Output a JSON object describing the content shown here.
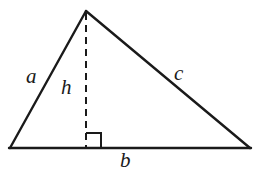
{
  "figure": {
    "type": "geometry-diagram",
    "background_color": "#ffffff",
    "stroke_color": "#1a1a1a",
    "canvas": {
      "width": 268,
      "height": 176
    }
  },
  "geometry": {
    "vertices": {
      "apex": {
        "name": "apex",
        "x": 86,
        "y": 11
      },
      "bottom_left": {
        "name": "bottom-left",
        "x": 10,
        "y": 148
      },
      "bottom_right": {
        "name": "bottom-right",
        "x": 250,
        "y": 148
      },
      "foot": {
        "name": "altitude-foot",
        "x": 86,
        "y": 148
      }
    },
    "sides": [
      {
        "id": "a",
        "from": "bottom_left",
        "to": "apex",
        "style": "solid",
        "stroke_width": 2.4
      },
      {
        "id": "c",
        "from": "apex",
        "to": "bottom_right",
        "style": "solid",
        "stroke_width": 2.4
      },
      {
        "id": "b",
        "from": "bottom_left",
        "to": "bottom_right",
        "style": "solid",
        "stroke_width": 2.4
      },
      {
        "id": "h",
        "from": "apex",
        "to": "foot",
        "style": "dashed",
        "stroke_width": 2.0,
        "dash_pattern": "7 5"
      }
    ],
    "right_angle_marker": {
      "x": 86,
      "y": 133,
      "size": 15,
      "stroke_width": 2.0
    }
  },
  "labels": {
    "side_a": {
      "text": "a",
      "meaning": "left-side-length"
    },
    "side_b": {
      "text": "b",
      "meaning": "base-length"
    },
    "side_c": {
      "text": "c",
      "meaning": "right-side-length"
    },
    "height": {
      "text": "h",
      "meaning": "altitude-height"
    }
  }
}
